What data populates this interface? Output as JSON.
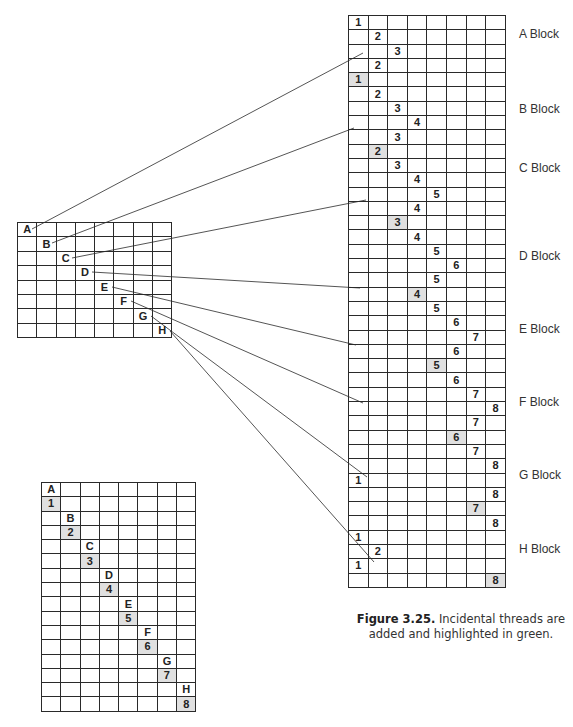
{
  "figure": {
    "number_label": "Figure 3.25.",
    "caption_text": " Incidental threads are added and highlighted in green."
  },
  "colors": {
    "highlight": "#e0e0e0",
    "grid_line": "#2a2a2a",
    "connector": "#555555"
  },
  "left_grid": {
    "rows": 8,
    "cols": 8,
    "cells": [
      {
        "row": 0,
        "col": 0,
        "text": "A"
      },
      {
        "row": 1,
        "col": 1,
        "text": "B"
      },
      {
        "row": 2,
        "col": 2,
        "text": "C"
      },
      {
        "row": 3,
        "col": 3,
        "text": "D"
      },
      {
        "row": 4,
        "col": 4,
        "text": "E"
      },
      {
        "row": 5,
        "col": 5,
        "text": "F"
      },
      {
        "row": 6,
        "col": 6,
        "text": "G"
      },
      {
        "row": 7,
        "col": 7,
        "text": "H"
      }
    ]
  },
  "right_grid": {
    "rows": 40,
    "cols": 8,
    "cells": [
      {
        "row": 0,
        "col": 0,
        "text": "1"
      },
      {
        "row": 1,
        "col": 1,
        "text": "2"
      },
      {
        "row": 2,
        "col": 2,
        "text": "3"
      },
      {
        "row": 3,
        "col": 1,
        "text": "2"
      },
      {
        "row": 4,
        "col": 0,
        "text": "1",
        "hl": true
      },
      {
        "row": 5,
        "col": 1,
        "text": "2"
      },
      {
        "row": 6,
        "col": 2,
        "text": "3"
      },
      {
        "row": 7,
        "col": 3,
        "text": "4"
      },
      {
        "row": 8,
        "col": 2,
        "text": "3"
      },
      {
        "row": 9,
        "col": 1,
        "text": "2",
        "hl": true
      },
      {
        "row": 10,
        "col": 2,
        "text": "3"
      },
      {
        "row": 11,
        "col": 3,
        "text": "4"
      },
      {
        "row": 12,
        "col": 4,
        "text": "5"
      },
      {
        "row": 13,
        "col": 3,
        "text": "4"
      },
      {
        "row": 14,
        "col": 2,
        "text": "3",
        "hl": true
      },
      {
        "row": 15,
        "col": 3,
        "text": "4"
      },
      {
        "row": 16,
        "col": 4,
        "text": "5"
      },
      {
        "row": 17,
        "col": 5,
        "text": "6"
      },
      {
        "row": 18,
        "col": 4,
        "text": "5"
      },
      {
        "row": 19,
        "col": 3,
        "text": "4",
        "hl": true
      },
      {
        "row": 20,
        "col": 4,
        "text": "5"
      },
      {
        "row": 21,
        "col": 5,
        "text": "6"
      },
      {
        "row": 22,
        "col": 6,
        "text": "7"
      },
      {
        "row": 23,
        "col": 5,
        "text": "6"
      },
      {
        "row": 24,
        "col": 4,
        "text": "5",
        "hl": true
      },
      {
        "row": 25,
        "col": 5,
        "text": "6"
      },
      {
        "row": 26,
        "col": 6,
        "text": "7"
      },
      {
        "row": 27,
        "col": 7,
        "text": "8"
      },
      {
        "row": 28,
        "col": 6,
        "text": "7"
      },
      {
        "row": 29,
        "col": 5,
        "text": "6",
        "hl": true
      },
      {
        "row": 30,
        "col": 6,
        "text": "7"
      },
      {
        "row": 31,
        "col": 7,
        "text": "8"
      },
      {
        "row": 32,
        "col": 0,
        "text": "1"
      },
      {
        "row": 33,
        "col": 7,
        "text": "8"
      },
      {
        "row": 34,
        "col": 6,
        "text": "7",
        "hl": true
      },
      {
        "row": 35,
        "col": 7,
        "text": "8"
      },
      {
        "row": 36,
        "col": 0,
        "text": "1"
      },
      {
        "row": 37,
        "col": 1,
        "text": "2"
      },
      {
        "row": 38,
        "col": 0,
        "text": "1"
      },
      {
        "row": 39,
        "col": 7,
        "text": "8",
        "hl": true
      }
    ]
  },
  "bottom_grid": {
    "rows": 16,
    "cols": 8,
    "cells": [
      {
        "row": 0,
        "col": 0,
        "text": "A"
      },
      {
        "row": 1,
        "col": 0,
        "text": "1",
        "hl": true
      },
      {
        "row": 2,
        "col": 1,
        "text": "B"
      },
      {
        "row": 3,
        "col": 1,
        "text": "2",
        "hl": true
      },
      {
        "row": 4,
        "col": 2,
        "text": "C"
      },
      {
        "row": 5,
        "col": 2,
        "text": "3",
        "hl": true
      },
      {
        "row": 6,
        "col": 3,
        "text": "D"
      },
      {
        "row": 7,
        "col": 3,
        "text": "4",
        "hl": true
      },
      {
        "row": 8,
        "col": 4,
        "text": "E"
      },
      {
        "row": 9,
        "col": 4,
        "text": "5",
        "hl": true
      },
      {
        "row": 10,
        "col": 5,
        "text": "F"
      },
      {
        "row": 11,
        "col": 5,
        "text": "6",
        "hl": true
      },
      {
        "row": 12,
        "col": 6,
        "text": "G"
      },
      {
        "row": 13,
        "col": 6,
        "text": "7",
        "hl": true
      },
      {
        "row": 14,
        "col": 7,
        "text": "H"
      },
      {
        "row": 15,
        "col": 7,
        "text": "8",
        "hl": true
      }
    ]
  },
  "block_labels": [
    {
      "text": "A Block",
      "top": 27
    },
    {
      "text": "B Block",
      "top": 102
    },
    {
      "text": "C Block",
      "top": 161
    },
    {
      "text": "D Block",
      "top": 249
    },
    {
      "text": "E Block",
      "top": 322
    },
    {
      "text": "F Block",
      "top": 395
    },
    {
      "text": "G Block",
      "top": 468
    },
    {
      "text": "H Block",
      "top": 542
    }
  ],
  "connectors": [
    {
      "from": "A",
      "x1": 32,
      "y1": 229,
      "x2": 363,
      "y2": 53
    },
    {
      "from": "B",
      "x1": 52,
      "y1": 243,
      "x2": 354,
      "y2": 128
    },
    {
      "from": "C",
      "x1": 72,
      "y1": 258,
      "x2": 366,
      "y2": 200
    },
    {
      "from": "D",
      "x1": 92,
      "y1": 272,
      "x2": 360,
      "y2": 288
    },
    {
      "from": "E",
      "x1": 112,
      "y1": 287,
      "x2": 356,
      "y2": 345
    },
    {
      "from": "F",
      "x1": 131,
      "y1": 301,
      "x2": 363,
      "y2": 403
    },
    {
      "from": "G",
      "x1": 151,
      "y1": 316,
      "x2": 367,
      "y2": 477
    },
    {
      "from": "H",
      "x1": 170,
      "y1": 331,
      "x2": 374,
      "y2": 562
    }
  ]
}
